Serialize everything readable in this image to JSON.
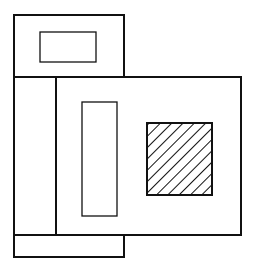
{
  "diagram": {
    "width": 255,
    "height": 270,
    "stroke_color": "#111111",
    "background": "#ffffff",
    "shapes": {
      "top_block": {
        "x": 14,
        "y": 15,
        "w": 110,
        "h": 62
      },
      "top_inner_rect": {
        "x": 40,
        "y": 32,
        "w": 56,
        "h": 30
      },
      "left_column": {
        "x": 14,
        "y": 77,
        "w": 42,
        "h": 158
      },
      "main_block": {
        "x": 56,
        "y": 77,
        "w": 185,
        "h": 158
      },
      "tall_inner_rect": {
        "x": 82,
        "y": 102,
        "w": 35,
        "h": 114
      },
      "hatched_square": {
        "x": 147,
        "y": 123,
        "w": 65,
        "h": 72
      },
      "bottom_block": {
        "x": 14,
        "y": 235,
        "w": 110,
        "h": 22
      }
    }
  }
}
